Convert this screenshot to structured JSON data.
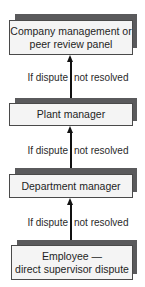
{
  "diagram": {
    "type": "escalation-flowchart",
    "nodes": [
      {
        "id": "company",
        "line1": "Company management or",
        "line2": "peer review panel"
      },
      {
        "id": "plant",
        "line1": "Plant manager",
        "line2": ""
      },
      {
        "id": "department",
        "line1": "Department manager",
        "line2": ""
      },
      {
        "id": "employee",
        "line1": "Employee —",
        "line2": "direct supervisor dispute"
      }
    ],
    "edges": [
      {
        "from": "employee",
        "to": "department",
        "label_left": "If dispute",
        "label_right": "not resolved"
      },
      {
        "from": "department",
        "to": "plant",
        "label_left": "If dispute",
        "label_right": "not resolved"
      },
      {
        "from": "plant",
        "to": "company",
        "label_left": "If dispute",
        "label_right": "not resolved"
      }
    ],
    "colors": {
      "box_fill": "#f4f4f4",
      "box_border": "#4a4a4a",
      "shadow": "#5a5a5c",
      "arrow": "#111111"
    }
  }
}
